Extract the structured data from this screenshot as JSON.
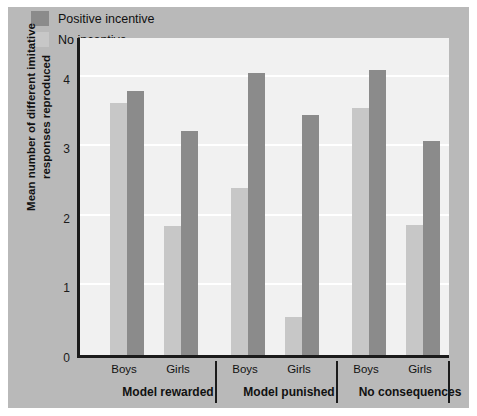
{
  "chart_data": {
    "type": "bar",
    "title": "",
    "xlabel": "",
    "ylabel": "Mean number of different imitative responses reproduced",
    "ylim": [
      0,
      4.6
    ],
    "yticks": [
      0,
      1,
      2,
      3,
      4
    ],
    "ytick_labels": [
      "0",
      "1",
      "2",
      "3",
      "4"
    ],
    "grid": true,
    "grid_orientation": "horizontal",
    "legend_position": "top-left",
    "groups": [
      "Model rewarded",
      "Model punished",
      "No consequences"
    ],
    "categories": [
      "Boys",
      "Girls",
      "Boys",
      "Girls",
      "Boys",
      "Girls"
    ],
    "series": [
      {
        "name": "No incentive",
        "color": "#c7c7c7",
        "values": [
          3.62,
          1.85,
          2.4,
          0.55,
          3.55,
          1.87
        ]
      },
      {
        "name": "Positive incentive",
        "color": "#8b8b8b",
        "values": [
          3.8,
          3.22,
          4.05,
          3.45,
          4.1,
          3.08
        ]
      }
    ]
  },
  "legend": {
    "items": [
      {
        "label": "Positive incentive",
        "swatch": "dark"
      },
      {
        "label": "No incentive",
        "swatch": "light"
      }
    ]
  },
  "axis": {
    "y_title": "Mean number of different imitative responses reproduced",
    "y_ticks": [
      "4",
      "3",
      "2",
      "1",
      "0"
    ]
  },
  "x_axis": {
    "subticks": [
      "Boys",
      "Girls",
      "Boys",
      "Girls",
      "Boys",
      "Girls"
    ],
    "groups": [
      "Model rewarded",
      "Model punished",
      "No consequences"
    ]
  },
  "colors": {
    "positive_incentive": "#8b8b8b",
    "no_incentive": "#c7c7c7",
    "plot_background": "#f1f1f1",
    "matte": "#b9b9b9",
    "axis": "#1b1b1b",
    "gridline": "#ffffff"
  }
}
